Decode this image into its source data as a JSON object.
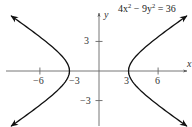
{
  "chart_data": {
    "type": "line",
    "equation": {
      "lhs_a": "4x",
      "exp1": "2",
      "minus": " − 9y",
      "exp2": "2",
      "rhs": " = 36"
    },
    "xlabel": "x",
    "ylabel": "y",
    "xticks": [
      -6,
      -3,
      3,
      6
    ],
    "yticks": [
      3,
      -3
    ],
    "xtick_labels": [
      "−6",
      "−3",
      "3",
      "6"
    ],
    "ytick_labels": [
      "3",
      "−3"
    ],
    "xlim": [
      -10,
      9.5
    ],
    "ylim": [
      -5.7,
      7.2
    ],
    "grid": false,
    "series": [
      {
        "name": "right branch",
        "curve": "x = 3·sqrt(1 + y²/4), x > 0",
        "vertex": [
          3,
          0
        ],
        "y_range": [
          -5.6,
          5.6
        ]
      },
      {
        "name": "left branch",
        "curve": "x = −3·sqrt(1 + y²/4), x < 0",
        "vertex": [
          -3,
          0
        ],
        "y_range": [
          -5.6,
          5.6
        ]
      }
    ],
    "colors": {
      "curve": "#111111",
      "axis": "#555555"
    }
  }
}
